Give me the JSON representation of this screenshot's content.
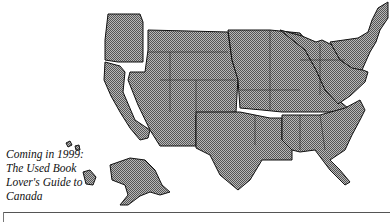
{
  "caption": {
    "lines": [
      "Coming in 1999:",
      "The Used Book",
      "Lover's Guide to",
      "Canada"
    ]
  },
  "map": {
    "label": "United States map divided into regions",
    "fill_color": "#8a8a8a",
    "border_color": "#111111",
    "gap_color": "#ffffff"
  }
}
